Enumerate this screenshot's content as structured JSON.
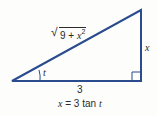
{
  "diagram": {
    "type": "right-triangle",
    "stroke_color": "#2a4b8d",
    "background_color": "#fdfdfb",
    "vertices": {
      "left": [
        12,
        81
      ],
      "bottom_right": [
        141,
        81
      ],
      "top_right": [
        141,
        10
      ]
    },
    "labels": {
      "hypotenuse_radicand_prefix": "9 + ",
      "hypotenuse_var": "x",
      "hypotenuse_exp": "2",
      "vertical_side": "x",
      "horizontal_side": "3",
      "angle": "t"
    },
    "caption": {
      "lhs": "x",
      "rhs": " = 3 tan ",
      "var": "t"
    }
  }
}
